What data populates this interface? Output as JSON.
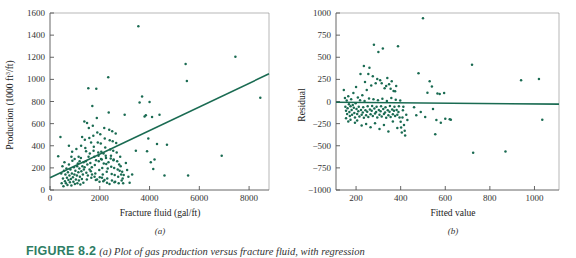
{
  "figure": {
    "caption_label": "FIGURE 8.2",
    "caption_text": "(a) Plot of gas production versus fracture fluid, with regression"
  },
  "panel_a": {
    "letter": "(a)",
    "ylabel_main": "Production (1000 ft",
    "ylabel_sup": "3",
    "ylabel_tail": "/ft)",
    "xlabel": "Fracture fluid (gal/ft)",
    "line_color": "#1a6b52",
    "point_color": "#1a6b52"
  },
  "panel_b": {
    "letter": "(b)",
    "ylabel": "Residual",
    "xlabel": "Fitted value",
    "line_color": "#1a6b52",
    "point_color": "#1a6b52"
  },
  "chart_data": [
    {
      "type": "scatter",
      "title": "",
      "panel": "a",
      "xlabel": "Fracture fluid (gal/ft)",
      "ylabel": "Production (1000 ft3/ft)",
      "xlim": [
        0,
        8800
      ],
      "ylim": [
        0,
        1600
      ],
      "xticks": [
        0,
        2000,
        4000,
        6000,
        8000
      ],
      "yticks": [
        0,
        200,
        400,
        600,
        800,
        1000,
        1200,
        1400,
        1600
      ],
      "grid": false,
      "legend": "none",
      "fit_line": {
        "x": [
          0,
          8800
        ],
        "y": [
          110,
          1050
        ]
      },
      "points": [
        [
          330,
          305
        ],
        [
          420,
          480
        ],
        [
          450,
          150
        ],
        [
          470,
          60
        ],
        [
          500,
          215
        ],
        [
          520,
          105
        ],
        [
          540,
          35
        ],
        [
          560,
          175
        ],
        [
          580,
          250
        ],
        [
          600,
          80
        ],
        [
          620,
          140
        ],
        [
          640,
          60
        ],
        [
          660,
          195
        ],
        [
          680,
          110
        ],
        [
          700,
          45
        ],
        [
          720,
          160
        ],
        [
          740,
          90
        ],
        [
          760,
          230
        ],
        [
          780,
          130
        ],
        [
          800,
          70
        ],
        [
          820,
          185
        ],
        [
          840,
          100
        ],
        [
          860,
          40
        ],
        [
          880,
          150
        ],
        [
          900,
          265
        ],
        [
          920,
          115
        ],
        [
          940,
          75
        ],
        [
          960,
          205
        ],
        [
          980,
          140
        ],
        [
          1000,
          55
        ],
        [
          1020,
          175
        ],
        [
          1040,
          95
        ],
        [
          1060,
          370
        ],
        [
          1080,
          130
        ],
        [
          1100,
          60
        ],
        [
          1120,
          240
        ],
        [
          1140,
          160
        ],
        [
          1160,
          85
        ],
        [
          1180,
          195
        ],
        [
          1200,
          120
        ],
        [
          1220,
          50
        ],
        [
          1240,
          290
        ],
        [
          1260,
          170
        ],
        [
          1280,
          100
        ],
        [
          1300,
          215
        ],
        [
          1320,
          140
        ],
        [
          1340,
          65
        ],
        [
          1360,
          185
        ],
        [
          1380,
          620
        ],
        [
          1400,
          455
        ],
        [
          1420,
          380
        ],
        [
          1440,
          260
        ],
        [
          1460,
          155
        ],
        [
          1480,
          95
        ],
        [
          1500,
          230
        ],
        [
          1520,
          130
        ],
        [
          1540,
          920
        ],
        [
          1560,
          560
        ],
        [
          1580,
          470
        ],
        [
          1600,
          330
        ],
        [
          1620,
          245
        ],
        [
          1640,
          170
        ],
        [
          1660,
          110
        ],
        [
          1680,
          205
        ],
        [
          1700,
          760
        ],
        [
          1720,
          580
        ],
        [
          1740,
          490
        ],
        [
          1760,
          390
        ],
        [
          1780,
          300
        ],
        [
          1800,
          225
        ],
        [
          1820,
          150
        ],
        [
          1840,
          90
        ],
        [
          1860,
          915
        ],
        [
          1880,
          650
        ],
        [
          1900,
          520
        ],
        [
          1920,
          430
        ],
        [
          1940,
          340
        ],
        [
          1960,
          260
        ],
        [
          1980,
          180
        ],
        [
          2000,
          115
        ],
        [
          2020,
          505
        ],
        [
          2040,
          420
        ],
        [
          2060,
          345
        ],
        [
          2080,
          275
        ],
        [
          2100,
          200
        ],
        [
          2120,
          140
        ],
        [
          2140,
          80
        ],
        [
          2160,
          240
        ],
        [
          2180,
          560
        ],
        [
          2200,
          465
        ],
        [
          2220,
          385
        ],
        [
          2240,
          310
        ],
        [
          2260,
          235
        ],
        [
          2280,
          165
        ],
        [
          2300,
          105
        ],
        [
          2320,
          195
        ],
        [
          2340,
          1020
        ],
        [
          2360,
          700
        ],
        [
          2380,
          545
        ],
        [
          2400,
          450
        ],
        [
          2420,
          365
        ],
        [
          2440,
          285
        ],
        [
          2460,
          210
        ],
        [
          2480,
          145
        ],
        [
          2500,
          530
        ],
        [
          2520,
          440
        ],
        [
          2540,
          355
        ],
        [
          2560,
          275
        ],
        [
          2580,
          200
        ],
        [
          2600,
          135
        ],
        [
          2620,
          75
        ],
        [
          2640,
          510
        ],
        [
          2660,
          425
        ],
        [
          2680,
          340
        ],
        [
          2700,
          260
        ],
        [
          2720,
          185
        ],
        [
          2740,
          120
        ],
        [
          2760,
          60
        ],
        [
          2780,
          230
        ],
        [
          2800,
          175
        ],
        [
          2820,
          300
        ],
        [
          2840,
          215
        ],
        [
          2860,
          140
        ],
        [
          2880,
          85
        ],
        [
          2900,
          165
        ],
        [
          2920,
          105
        ],
        [
          2940,
          60
        ],
        [
          2960,
          135
        ],
        [
          3000,
          680
        ],
        [
          3050,
          245
        ],
        [
          3100,
          180
        ],
        [
          3150,
          120
        ],
        [
          3200,
          65
        ],
        [
          3300,
          140
        ],
        [
          3450,
          355
        ],
        [
          3550,
          1480
        ],
        [
          3600,
          790
        ],
        [
          3700,
          845
        ],
        [
          3800,
          665
        ],
        [
          3850,
          675
        ],
        [
          3900,
          350
        ],
        [
          3950,
          465
        ],
        [
          4000,
          795
        ],
        [
          4050,
          250
        ],
        [
          4100,
          660
        ],
        [
          4150,
          190
        ],
        [
          4200,
          275
        ],
        [
          4300,
          415
        ],
        [
          4400,
          680
        ],
        [
          4600,
          130
        ],
        [
          4700,
          410
        ],
        [
          5450,
          1140
        ],
        [
          5500,
          985
        ],
        [
          5550,
          130
        ],
        [
          6900,
          310
        ],
        [
          7450,
          1205
        ],
        [
          8450,
          835
        ],
        [
          1150,
          300
        ],
        [
          1250,
          400
        ],
        [
          1350,
          250
        ],
        [
          1450,
          350
        ],
        [
          1550,
          300
        ],
        [
          1650,
          430
        ],
        [
          1750,
          355
        ],
        [
          1850,
          270
        ],
        [
          1950,
          310
        ],
        [
          2050,
          280
        ],
        [
          2150,
          330
        ],
        [
          2250,
          290
        ],
        [
          2350,
          250
        ],
        [
          2450,
          310
        ],
        [
          2550,
          270
        ],
        [
          890,
          345
        ],
        [
          990,
          280
        ],
        [
          1090,
          215
        ],
        [
          1190,
          260
        ],
        [
          760,
          400
        ],
        [
          860,
          300
        ],
        [
          1290,
          480
        ],
        [
          1390,
          205
        ],
        [
          1490,
          605
        ],
        [
          1590,
          185
        ],
        [
          1690,
          140
        ],
        [
          1790,
          120
        ],
        [
          1890,
          95
        ],
        [
          1990,
          75
        ],
        [
          2090,
          110
        ],
        [
          2190,
          90
        ],
        [
          2290,
          65
        ],
        [
          2390,
          55
        ],
        [
          2490,
          85
        ],
        [
          2590,
          70
        ]
      ]
    },
    {
      "type": "scatter",
      "title": "",
      "panel": "b",
      "xlabel": "Fitted value",
      "ylabel": "Residual",
      "xlim": [
        110,
        1110
      ],
      "ylim": [
        -1000,
        1000
      ],
      "xticks": [
        200,
        400,
        600,
        800,
        1000
      ],
      "yticks": [
        -1000,
        -750,
        -500,
        -250,
        0,
        250,
        500,
        750,
        1000
      ],
      "grid": false,
      "legend": "none",
      "fit_line": {
        "x": [
          110,
          1110
        ],
        "y": [
          -8,
          -30
        ]
      },
      "points": [
        [
          145,
          130
        ],
        [
          150,
          40
        ],
        [
          152,
          -60
        ],
        [
          155,
          -105
        ],
        [
          158,
          10
        ],
        [
          160,
          -140
        ],
        [
          162,
          -75
        ],
        [
          165,
          60
        ],
        [
          168,
          -30
        ],
        [
          170,
          -120
        ],
        [
          172,
          -165
        ],
        [
          175,
          -55
        ],
        [
          178,
          25
        ],
        [
          180,
          -95
        ],
        [
          182,
          -150
        ],
        [
          185,
          -40
        ],
        [
          188,
          95
        ],
        [
          190,
          -70
        ],
        [
          192,
          -130
        ],
        [
          195,
          -180
        ],
        [
          198,
          -20
        ],
        [
          200,
          165
        ],
        [
          202,
          -85
        ],
        [
          205,
          -140
        ],
        [
          208,
          45
        ],
        [
          210,
          -110
        ],
        [
          212,
          -60
        ],
        [
          215,
          -170
        ],
        [
          218,
          15
        ],
        [
          220,
          310
        ],
        [
          222,
          -95
        ],
        [
          225,
          -150
        ],
        [
          228,
          70
        ],
        [
          230,
          -125
        ],
        [
          232,
          -65
        ],
        [
          235,
          -185
        ],
        [
          238,
          5
        ],
        [
          240,
          220
        ],
        [
          242,
          -100
        ],
        [
          245,
          -155
        ],
        [
          248,
          130
        ],
        [
          250,
          -115
        ],
        [
          252,
          -55
        ],
        [
          255,
          -175
        ],
        [
          258,
          35
        ],
        [
          260,
          380
        ],
        [
          262,
          -90
        ],
        [
          265,
          -145
        ],
        [
          268,
          180
        ],
        [
          270,
          -105
        ],
        [
          272,
          -50
        ],
        [
          275,
          -165
        ],
        [
          278,
          25
        ],
        [
          280,
          640
        ],
        [
          282,
          -80
        ],
        [
          285,
          -135
        ],
        [
          288,
          205
        ],
        [
          290,
          -120
        ],
        [
          292,
          -60
        ],
        [
          295,
          -180
        ],
        [
          298,
          15
        ],
        [
          300,
          560
        ],
        [
          302,
          -95
        ],
        [
          305,
          -150
        ],
        [
          308,
          240
        ],
        [
          310,
          -110
        ],
        [
          312,
          -55
        ],
        [
          315,
          -170
        ],
        [
          318,
          30
        ],
        [
          320,
          600
        ],
        [
          322,
          -85
        ],
        [
          325,
          -140
        ],
        [
          328,
          150
        ],
        [
          330,
          -125
        ],
        [
          332,
          -65
        ],
        [
          335,
          -185
        ],
        [
          338,
          5
        ],
        [
          340,
          265
        ],
        [
          342,
          -100
        ],
        [
          345,
          -155
        ],
        [
          348,
          195
        ],
        [
          350,
          -115
        ],
        [
          352,
          -50
        ],
        [
          355,
          -175
        ],
        [
          358,
          40
        ],
        [
          360,
          230
        ],
        [
          362,
          -90
        ],
        [
          365,
          -145
        ],
        [
          368,
          120
        ],
        [
          370,
          -105
        ],
        [
          372,
          -60
        ],
        [
          375,
          -165
        ],
        [
          378,
          20
        ],
        [
          380,
          175
        ],
        [
          382,
          -95
        ],
        [
          385,
          -150
        ],
        [
          388,
          625
        ],
        [
          390,
          -120
        ],
        [
          392,
          -55
        ],
        [
          395,
          -180
        ],
        [
          398,
          10
        ],
        [
          400,
          -230
        ],
        [
          402,
          -295
        ],
        [
          405,
          -350
        ],
        [
          408,
          -180
        ],
        [
          410,
          -100
        ],
        [
          412,
          -60
        ],
        [
          415,
          -265
        ],
        [
          418,
          -330
        ],
        [
          420,
          -385
        ],
        [
          425,
          -150
        ],
        [
          430,
          -210
        ],
        [
          245,
          -255
        ],
        [
          265,
          -290
        ],
        [
          285,
          -245
        ],
        [
          305,
          -310
        ],
        [
          325,
          -265
        ],
        [
          345,
          -340
        ],
        [
          365,
          -225
        ],
        [
          385,
          -300
        ],
        [
          205,
          -215
        ],
        [
          225,
          -270
        ],
        [
          175,
          -205
        ],
        [
          195,
          -240
        ],
        [
          155,
          -190
        ],
        [
          165,
          -225
        ],
        [
          235,
          400
        ],
        [
          255,
          310
        ],
        [
          275,
          285
        ],
        [
          295,
          255
        ],
        [
          315,
          205
        ],
        [
          335,
          175
        ],
        [
          355,
          145
        ],
        [
          375,
          115
        ],
        [
          480,
          320
        ],
        [
          500,
          940
        ],
        [
          530,
          230
        ],
        [
          540,
          170
        ],
        [
          555,
          -370
        ],
        [
          565,
          90
        ],
        [
          575,
          85
        ],
        [
          595,
          95
        ],
        [
          600,
          -195
        ],
        [
          620,
          -200
        ],
        [
          625,
          -205
        ],
        [
          545,
          -85
        ],
        [
          720,
          415
        ],
        [
          725,
          -580
        ],
        [
          870,
          -565
        ],
        [
          940,
          240
        ],
        [
          1020,
          255
        ],
        [
          1035,
          -205
        ],
        [
          460,
          -65
        ],
        [
          470,
          -155
        ],
        [
          490,
          -120
        ],
        [
          510,
          -175
        ],
        [
          520,
          100
        ],
        [
          560,
          -210
        ],
        [
          580,
          -240
        ]
      ]
    }
  ]
}
